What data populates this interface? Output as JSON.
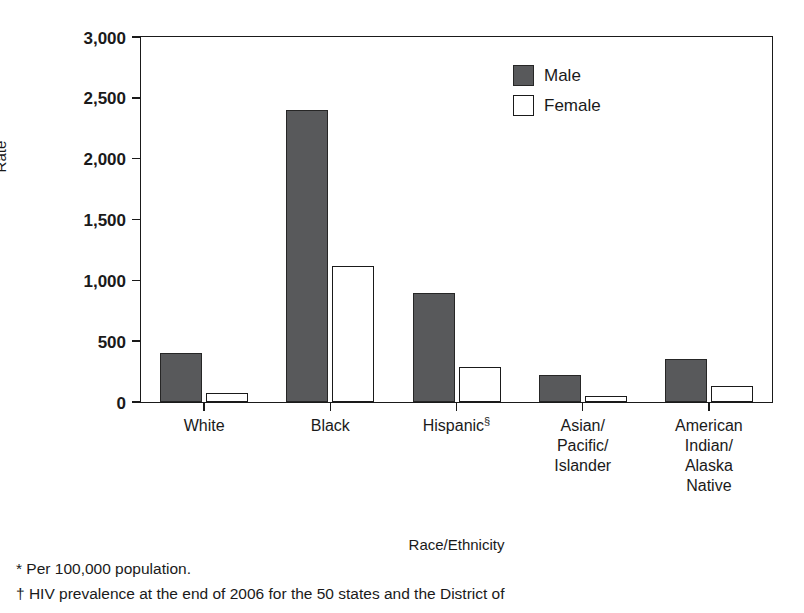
{
  "chart_data": {
    "type": "bar",
    "title": "",
    "xlabel": "Race/Ethnicity",
    "ylabel": "Rate",
    "ylim": [
      0,
      3000
    ],
    "yticks": [
      0,
      500,
      1000,
      1500,
      2000,
      2500,
      3000
    ],
    "ytick_labels": [
      "0",
      "500",
      "1,000",
      "1,500",
      "2,000",
      "2,500",
      "3,000"
    ],
    "grid": false,
    "legend_position": "top-right-inside",
    "categories": [
      "White",
      "Black",
      "Hispanic",
      "Asian/Pacific/Islander",
      "American Indian/Alaska Native"
    ],
    "category_labels": [
      {
        "lines": [
          "White"
        ],
        "marker": ""
      },
      {
        "lines": [
          "Black"
        ],
        "marker": ""
      },
      {
        "lines": [
          "Hispanic"
        ],
        "marker": "§"
      },
      {
        "lines": [
          "Asian/",
          "Pacific/",
          "Islander"
        ],
        "marker": ""
      },
      {
        "lines": [
          "American",
          "Indian/",
          "Alaska",
          "Native"
        ],
        "marker": ""
      }
    ],
    "series": [
      {
        "name": "Male",
        "color": "#58595b",
        "values": [
          400,
          2400,
          900,
          220,
          350
        ]
      },
      {
        "name": "Female",
        "color": "#ffffff",
        "values": [
          70,
          1120,
          290,
          50,
          130
        ]
      }
    ]
  },
  "legend": {
    "items": [
      {
        "label": "Male",
        "style": "filled"
      },
      {
        "label": "Female",
        "style": "outline"
      }
    ]
  },
  "footnotes": [
    "* Per 100,000 population.",
    "† HIV prevalence at the end of 2006 for the 50 states and the District of"
  ],
  "colors": {
    "male_fill": "#58595b",
    "female_fill": "#ffffff",
    "axis": "#1a1a1a",
    "background": "#ffffff"
  }
}
